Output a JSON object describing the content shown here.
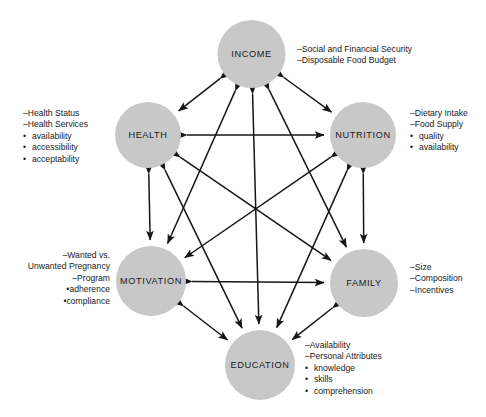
{
  "diagram": {
    "layout": "hexagon-network",
    "circle_fill": "#c8c8c8",
    "arrow_color": "#161616",
    "background": "#ffffff"
  },
  "nodes": [
    {
      "id": "income",
      "label": "INCOME",
      "cx": 251.5,
      "cy": 54,
      "r": 34,
      "annotation_align": "left",
      "annotation_x": 297,
      "annotation_y": 44,
      "items": [
        {
          "kind": "dash",
          "text": "–Social and Financial Security"
        },
        {
          "kind": "dash",
          "text": "–Disposable Food Budget"
        }
      ]
    },
    {
      "id": "health",
      "label": "HEALTH",
      "cx": 148,
      "cy": 135,
      "r": 33,
      "annotation_align": "left",
      "annotation_x": 23,
      "annotation_y": 108,
      "items": [
        {
          "kind": "dash",
          "text": "–Health Status"
        },
        {
          "kind": "dash",
          "text": "–Health Services"
        },
        {
          "kind": "bullet",
          "text": "availability"
        },
        {
          "kind": "bullet",
          "text": "accessibility"
        },
        {
          "kind": "bullet",
          "text": "acceptability"
        }
      ]
    },
    {
      "id": "nutrition",
      "label": "NUTRITION",
      "cx": 363,
      "cy": 135,
      "r": 33,
      "annotation_align": "left",
      "annotation_x": 410,
      "annotation_y": 108,
      "items": [
        {
          "kind": "dash",
          "text": "–Dietary Intake"
        },
        {
          "kind": "dash",
          "text": "–Food Supply"
        },
        {
          "kind": "bullet",
          "text": "quality"
        },
        {
          "kind": "bullet",
          "text": "availability"
        }
      ]
    },
    {
      "id": "motivation",
      "label": "MOTIVATION",
      "cx": 151,
      "cy": 281,
      "r": 35,
      "annotation_align": "right",
      "annotation_x": 14,
      "annotation_y": 250,
      "annotation_width": 96,
      "items": [
        {
          "kind": "dash",
          "text": "–Wanted vs."
        },
        {
          "kind": "plain",
          "text": "Unwanted Pregnancy"
        },
        {
          "kind": "dash",
          "text": "–Program"
        },
        {
          "kind": "bullet",
          "text": "adherence"
        },
        {
          "kind": "bullet",
          "text": "compliance"
        }
      ]
    },
    {
      "id": "family",
      "label": "FAMILY",
      "cx": 364,
      "cy": 283,
      "r": 34,
      "annotation_align": "left",
      "annotation_x": 410,
      "annotation_y": 262,
      "items": [
        {
          "kind": "dash",
          "text": "–Size"
        },
        {
          "kind": "dash",
          "text": "–Composition"
        },
        {
          "kind": "dash",
          "text": "–Incentives"
        }
      ]
    },
    {
      "id": "education",
      "label": "EDUCATION",
      "cx": 260,
      "cy": 365,
      "r": 35,
      "annotation_align": "left",
      "annotation_x": 305,
      "annotation_y": 340,
      "items": [
        {
          "kind": "dash",
          "text": "–Availability"
        },
        {
          "kind": "dash",
          "text": "–Personal Attributes"
        },
        {
          "kind": "bullet",
          "text": "knowledge"
        },
        {
          "kind": "bullet",
          "text": "skills"
        },
        {
          "kind": "bullet",
          "text": "comprehension"
        }
      ]
    }
  ],
  "edges": [
    {
      "from": "income",
      "to": "health",
      "name": "income-health-arrow"
    },
    {
      "from": "income",
      "to": "nutrition",
      "name": "income-nutrition-arrow"
    },
    {
      "from": "income",
      "to": "motivation",
      "name": "income-motivation-arrow"
    },
    {
      "from": "income",
      "to": "family",
      "name": "income-family-arrow"
    },
    {
      "from": "income",
      "to": "education",
      "name": "income-education-arrow"
    },
    {
      "from": "health",
      "to": "nutrition",
      "name": "health-nutrition-arrow"
    },
    {
      "from": "health",
      "to": "motivation",
      "name": "health-motivation-arrow"
    },
    {
      "from": "health",
      "to": "family",
      "name": "health-family-arrow"
    },
    {
      "from": "health",
      "to": "education",
      "name": "health-education-arrow"
    },
    {
      "from": "nutrition",
      "to": "motivation",
      "name": "nutrition-motivation-arrow"
    },
    {
      "from": "nutrition",
      "to": "family",
      "name": "nutrition-family-arrow"
    },
    {
      "from": "nutrition",
      "to": "education",
      "name": "nutrition-education-arrow"
    },
    {
      "from": "motivation",
      "to": "family",
      "name": "motivation-family-arrow"
    },
    {
      "from": "motivation",
      "to": "education",
      "name": "motivation-education-arrow"
    },
    {
      "from": "family",
      "to": "education",
      "name": "family-education-arrow"
    }
  ]
}
